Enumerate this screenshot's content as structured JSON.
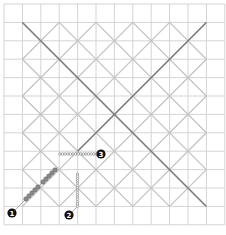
{
  "diagram": {
    "type": "grid-with-diamond-lattice",
    "grid": {
      "cells": 12,
      "origin": [
        4,
        4
      ],
      "cell_size": 18.4,
      "color": "#d4d4d4"
    },
    "lattice": {
      "inner_from_cell": 1,
      "inner_to_cell": 11,
      "step_cells": 2,
      "color": "#c4c4c4",
      "main_color": "#7a7a7a"
    },
    "bead_color": "#8a8a8a",
    "markers": [
      {
        "id": "marker-1",
        "label": "1",
        "x": 12,
        "y": 213
      },
      {
        "id": "marker-2",
        "label": "2",
        "x": 69,
        "y": 215
      },
      {
        "id": "marker-3",
        "label": "3",
        "x": 101,
        "y": 154
      }
    ]
  }
}
